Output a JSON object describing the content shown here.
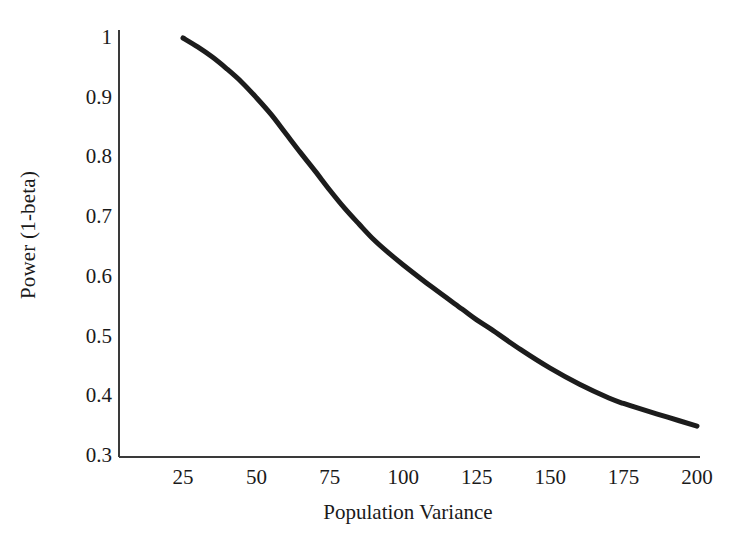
{
  "chart_data": {
    "type": "line",
    "title": "",
    "subtitle": "",
    "xlabel": "Population Variance",
    "ylabel": "Power (1-beta)",
    "xlim": [
      25,
      200
    ],
    "ylim": [
      0.3,
      1.0
    ],
    "grid": false,
    "legend": null,
    "line_color": "#1c1c1c",
    "line_width": 5,
    "axis_color": "#3a3a3a",
    "background": "#ffffff",
    "x_ticks": [
      25,
      50,
      75,
      100,
      125,
      150,
      175,
      200
    ],
    "x_tick_labels": [
      "25",
      "50",
      "75",
      "100",
      "125",
      "150",
      "175",
      "200"
    ],
    "y_ticks": [
      0.3,
      0.4,
      0.5,
      0.6,
      0.7,
      0.8,
      0.9,
      1.0
    ],
    "y_tick_labels": [
      "0.3",
      "0.4",
      "0.5",
      "0.6",
      "0.7",
      "0.8",
      "0.9",
      "1"
    ],
    "series": [
      {
        "name": "Power curve",
        "x": [
          25,
          30,
          35,
          40,
          45,
          50,
          55,
          60,
          65,
          70,
          75,
          80,
          85,
          90,
          95,
          100,
          110,
          120,
          125,
          130,
          140,
          150,
          160,
          170,
          175,
          180,
          190,
          200
        ],
        "values": [
          1.0,
          0.985,
          0.968,
          0.948,
          0.926,
          0.9,
          0.872,
          0.84,
          0.808,
          0.777,
          0.745,
          0.715,
          0.688,
          0.662,
          0.64,
          0.62,
          0.582,
          0.546,
          0.528,
          0.512,
          0.478,
          0.447,
          0.42,
          0.397,
          0.388,
          0.38,
          0.365,
          0.35
        ]
      }
    ],
    "annotations": []
  }
}
